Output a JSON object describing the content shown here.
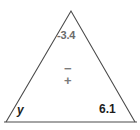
{
  "figure": {
    "kind": "triangle-diagram",
    "background_color": "#ffffff",
    "stroke_color": "#4a4a4a",
    "stroke_width": 1,
    "width": 140,
    "height": 130,
    "vertices": {
      "apex": {
        "x": 71,
        "y": 11
      },
      "bottom_left": {
        "x": 6,
        "y": 122
      },
      "bottom_right": {
        "x": 135,
        "y": 122
      }
    },
    "baseline": {
      "x1": 4,
      "y1": 122,
      "x2": 137,
      "y2": 122
    }
  },
  "labels": {
    "apex_value": "-3.4",
    "center_minus": "−",
    "center_plus": "+",
    "bottom_left_variable": "y",
    "bottom_right_value": "6.1"
  },
  "colors": {
    "label_gray": "#6b6b6b",
    "label_dark": "#1d1d1d",
    "outline": "#4a4a4a"
  }
}
